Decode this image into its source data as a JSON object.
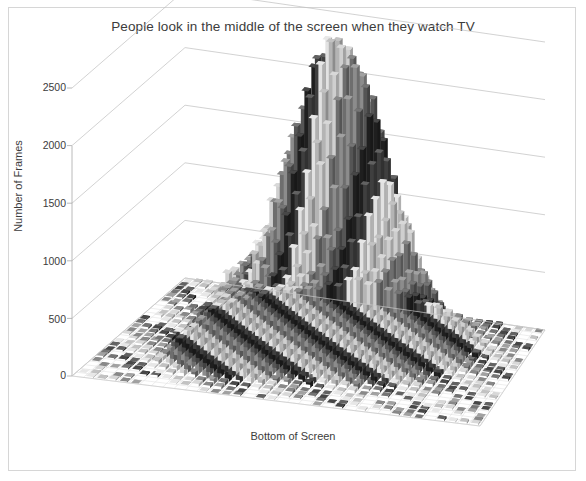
{
  "figure": {
    "title": "People look in the middle of the screen when they watch TV",
    "border_color": "#d6d6d6",
    "background": "#ffffff"
  },
  "axes": {
    "y_title": "Number of Frames",
    "x_title": "Bottom of Screen",
    "y_ticks": [
      "0",
      "500",
      "1000",
      "1500",
      "2000",
      "2500"
    ]
  },
  "chart_data": {
    "type": "bar",
    "title": "People look in the middle of the screen when they watch TV",
    "subtitle": "",
    "projection": "3d-column",
    "xlabel": "Bottom of Screen",
    "ylabel": "Number of Frames",
    "zlabel": "",
    "ylim": [
      0,
      2700
    ],
    "y_ticks": [
      0,
      500,
      1000,
      1500,
      2000,
      2500
    ],
    "grid": true,
    "legend": "none",
    "colormap": "grayscale",
    "grid_cols": 36,
    "grid_rows": 26,
    "peak_value": 2620,
    "peak_col": 18,
    "peak_row": 9,
    "sigma_col": 4.6,
    "sigma_row": 4.0,
    "secondary_peak": {
      "col": 11,
      "row": 17,
      "value": 640,
      "sigma_col": 2.6,
      "sigma_row": 2.4
    },
    "noise_amplitude": 110,
    "categories": [
      "left edge",
      "left",
      "centre-left",
      "centre",
      "centre-right",
      "right",
      "right edge"
    ],
    "values": [
      60,
      240,
      980,
      2620,
      1050,
      260,
      70
    ],
    "annotations": []
  },
  "ytick_positions": [
    {
      "label": "2500",
      "y": 88
    },
    {
      "label": "2000",
      "y": 146
    },
    {
      "label": "1500",
      "y": 204
    },
    {
      "label": "1000",
      "y": 262
    },
    {
      "label": "500",
      "y": 320
    },
    {
      "label": "0",
      "y": 376
    }
  ]
}
